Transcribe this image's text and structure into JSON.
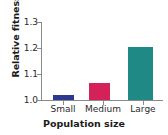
{
  "chart_data": {
    "type": "bar",
    "title": "",
    "xlabel": "Population size",
    "ylabel": "Relative fitness",
    "categories": [
      "Small",
      "Medium",
      "Large"
    ],
    "values": [
      1.02,
      1.065,
      1.205
    ],
    "colors": [
      "#2b3a8f",
      "#d4215a",
      "#1f8a85"
    ],
    "ylim": [
      1.0,
      1.3
    ],
    "yticks": [
      "1.0",
      "1.1",
      "1.2",
      "1.3"
    ],
    "ytick_values": [
      1.0,
      1.1,
      1.2,
      1.3
    ],
    "grid": false,
    "legend": "none",
    "axis_color": "#8a8a8a",
    "background": "#ffffff"
  }
}
